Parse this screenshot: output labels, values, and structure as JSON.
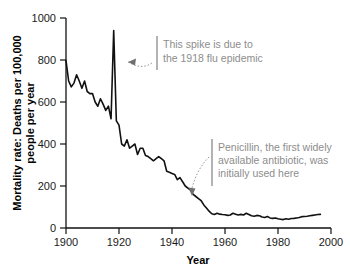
{
  "chart_data": {
    "type": "line",
    "title": "",
    "xlabel": "Year",
    "ylabel": "Mortality rate: Deaths per 100,000 people per year",
    "ylabel_line1": "Mortality rate: Deaths per 100,000",
    "ylabel_line2": "people per year",
    "xlim": [
      1900,
      2000
    ],
    "ylim": [
      0,
      1000
    ],
    "xticks": [
      1900,
      1920,
      1940,
      1960,
      1980,
      2000
    ],
    "xtick_labels": [
      "1900",
      "1920",
      "1940",
      "1960",
      "1980",
      "2000"
    ],
    "yticks": [
      0,
      200,
      400,
      600,
      800,
      1000
    ],
    "ytick_labels": [
      "0",
      "200",
      "400",
      "600",
      "800",
      "1000"
    ],
    "grid": false,
    "legend": "none",
    "line_color": "#111111",
    "series": [
      {
        "name": "Infectious disease mortality rate",
        "x": [
          1900,
          1901,
          1902,
          1903,
          1904,
          1905,
          1906,
          1907,
          1908,
          1909,
          1910,
          1911,
          1912,
          1913,
          1914,
          1915,
          1916,
          1917,
          1918,
          1919,
          1920,
          1921,
          1922,
          1923,
          1924,
          1925,
          1926,
          1927,
          1928,
          1929,
          1930,
          1931,
          1932,
          1933,
          1934,
          1935,
          1936,
          1937,
          1938,
          1939,
          1940,
          1941,
          1942,
          1943,
          1944,
          1945,
          1946,
          1947,
          1948,
          1949,
          1950,
          1951,
          1952,
          1953,
          1954,
          1955,
          1956,
          1957,
          1958,
          1959,
          1960,
          1961,
          1962,
          1963,
          1964,
          1965,
          1966,
          1967,
          1968,
          1969,
          1970,
          1971,
          1972,
          1973,
          1974,
          1975,
          1976,
          1977,
          1978,
          1979,
          1980,
          1981,
          1982,
          1983,
          1984,
          1985,
          1986,
          1987,
          1988,
          1989,
          1990,
          1991,
          1992,
          1993,
          1994,
          1995,
          1996
        ],
        "values": [
          797,
          700,
          672,
          690,
          730,
          700,
          665,
          700,
          650,
          640,
          640,
          600,
          580,
          615,
          590,
          560,
          580,
          520,
          940,
          510,
          490,
          400,
          390,
          420,
          380,
          390,
          400,
          350,
          380,
          380,
          345,
          340,
          330,
          320,
          330,
          340,
          330,
          320,
          270,
          265,
          260,
          255,
          230,
          240,
          220,
          200,
          190,
          180,
          160,
          150,
          140,
          130,
          110,
          95,
          80,
          68,
          64,
          70,
          66,
          64,
          63,
          60,
          62,
          70,
          66,
          62,
          65,
          62,
          70,
          64,
          58,
          56,
          60,
          58,
          52,
          50,
          55,
          48,
          46,
          48,
          44,
          42,
          40,
          44,
          42,
          45,
          46,
          48,
          50,
          54,
          55,
          56,
          58,
          60,
          62,
          64,
          65
        ]
      }
    ],
    "annotations": [
      {
        "id": "flu-spike",
        "lines": [
          "This spike is due to",
          "the 1918 flu epidemic"
        ],
        "points_to_year": 1918,
        "points_to_value": 800
      },
      {
        "id": "penicillin",
        "lines": [
          "Penicillin, the first widely",
          "available antibiotic, was",
          "initially used here"
        ],
        "points_to_year": 1948,
        "points_to_value": 160
      }
    ]
  },
  "colors": {
    "line": "#111111",
    "axis": "#111111",
    "tick_text": "#1a1a1a",
    "annotation_text": "#8d8d8d",
    "annotation_bar": "#9a9a9a",
    "background": "#ffffff"
  }
}
